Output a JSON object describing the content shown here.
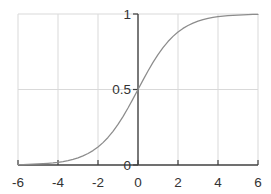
{
  "window": {
    "background": "#ffffff"
  },
  "chart_data": {
    "type": "line",
    "title": "",
    "xlabel": "",
    "ylabel": "",
    "xlim": [
      -6,
      6
    ],
    "ylim": [
      0,
      1
    ],
    "grid": true,
    "legend": "none",
    "axis_style": "y-axis-drawn-at-x-zero, x-axis-at-y-zero, inward-x-ticks, left-pointing-y-ticks",
    "x_ticks": {
      "values": [
        -6,
        -4,
        -2,
        0,
        2,
        4,
        6
      ],
      "labels": [
        "-6",
        "-4",
        "-2",
        "0",
        "2",
        "4",
        "6"
      ]
    },
    "y_ticks": {
      "values": [
        0,
        0.5,
        1
      ],
      "labels": [
        "0",
        "0.5",
        "1"
      ]
    },
    "colors": {
      "curve": "#8c8c8c",
      "axis": "#404040",
      "grid": "#d9d9d9",
      "tick_label": "#333333",
      "background": "#ffffff"
    },
    "series": [
      {
        "name": "logistic-sigmoid",
        "formula": "y = 1 / (1 + exp(-x))",
        "color": "#8c8c8c",
        "x": [
          -6,
          -5.75,
          -5.5,
          -5.25,
          -5,
          -4.75,
          -4.5,
          -4.25,
          -4,
          -3.75,
          -3.5,
          -3.25,
          -3,
          -2.75,
          -2.5,
          -2.25,
          -2,
          -1.75,
          -1.5,
          -1.25,
          -1,
          -0.75,
          -0.5,
          -0.25,
          0,
          0.25,
          0.5,
          0.75,
          1,
          1.25,
          1.5,
          1.75,
          2,
          2.25,
          2.5,
          2.75,
          3,
          3.25,
          3.5,
          3.75,
          4,
          4.25,
          4.5,
          4.75,
          5,
          5.25,
          5.5,
          5.75,
          6
        ],
        "y": [
          0.0025,
          0.0032,
          0.0041,
          0.0052,
          0.0067,
          0.0086,
          0.011,
          0.0141,
          0.018,
          0.023,
          0.0293,
          0.0374,
          0.0474,
          0.0601,
          0.0759,
          0.0953,
          0.1192,
          0.148,
          0.1824,
          0.2227,
          0.2689,
          0.3208,
          0.3775,
          0.4378,
          0.5,
          0.5622,
          0.6225,
          0.6792,
          0.7311,
          0.7773,
          0.8176,
          0.852,
          0.8808,
          0.9047,
          0.9241,
          0.9399,
          0.9526,
          0.9626,
          0.9707,
          0.977,
          0.982,
          0.9859,
          0.989,
          0.9914,
          0.9933,
          0.9948,
          0.9959,
          0.9968,
          0.9975
        ]
      }
    ],
    "plot_geometry": {
      "left": 18,
      "right": 258,
      "top": 14,
      "bottom": 165,
      "tick_length": 5
    }
  }
}
